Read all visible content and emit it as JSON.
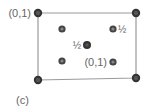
{
  "figure": {
    "panel_label": "(c)",
    "cell": {
      "corners": [
        {
          "x": 38,
          "y": 13
        },
        {
          "x": 136,
          "y": 13
        },
        {
          "x": 136,
          "y": 78
        },
        {
          "x": 38,
          "y": 80
        }
      ],
      "line_color": "#999999"
    },
    "atoms": [
      {
        "id": "corner-tl",
        "x": 38,
        "y": 13,
        "type": "corner",
        "label": "(0,1)",
        "label_side": "left"
      },
      {
        "id": "corner-tr",
        "x": 136,
        "y": 13,
        "type": "corner",
        "label": ""
      },
      {
        "id": "corner-bl",
        "x": 38,
        "y": 80,
        "type": "corner",
        "label": ""
      },
      {
        "id": "corner-br",
        "x": 136,
        "y": 78,
        "type": "corner",
        "label": ""
      },
      {
        "id": "inner-ul",
        "x": 62,
        "y": 29,
        "type": "inner",
        "label": ""
      },
      {
        "id": "inner-ur",
        "x": 113,
        "y": 29,
        "type": "inner",
        "label": "½",
        "label_side": "right"
      },
      {
        "id": "center",
        "x": 87,
        "y": 45,
        "type": "center",
        "label": "½",
        "label_side": "left"
      },
      {
        "id": "inner-ll",
        "x": 62,
        "y": 61,
        "type": "inner",
        "label": ""
      },
      {
        "id": "inner-lr",
        "x": 113,
        "y": 62,
        "type": "inner",
        "label": "(0,1)",
        "label_side": "left"
      }
    ],
    "colors": {
      "atom_dark": "#333333",
      "atom_inner_fill": "#777777",
      "label": "#666666"
    }
  }
}
